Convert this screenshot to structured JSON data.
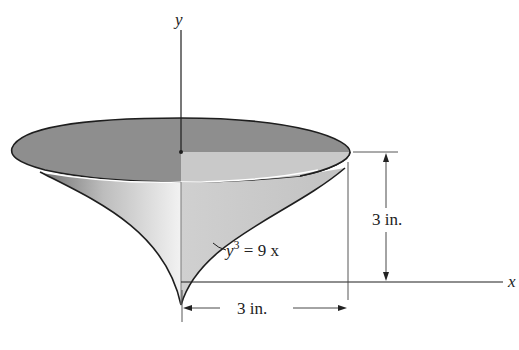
{
  "figure": {
    "type": "3D solid of revolution diagram",
    "axes": {
      "y_label": "y",
      "x_label": "x"
    },
    "curve": {
      "equation_lhs": "y",
      "equation_exp": "3",
      "equation_rhs": " = 9 x"
    },
    "dimensions": {
      "height": "3 in.",
      "radius": "3 in."
    },
    "colors": {
      "top_disk_dark": "#8a8a8a",
      "top_disk_light_quadrant": "#c8c8c8",
      "surface_light": "#e6e6e6",
      "surface_shade": "#9a9a9a",
      "line": "#222222"
    }
  }
}
